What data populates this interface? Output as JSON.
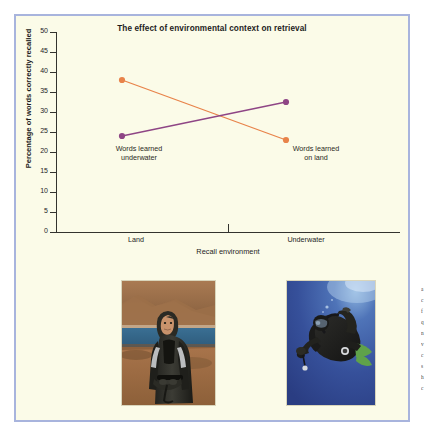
{
  "figure": {
    "background_color": "#fbfbe8",
    "border_color": "#a8b4dd"
  },
  "chart_data": {
    "type": "line",
    "title": "The effect of environmental context on retrieval",
    "xlabel": "Recall environment",
    "ylabel": "Percentage of words correctly recalled",
    "categories": [
      "Land",
      "Underwater"
    ],
    "ylim": [
      0,
      50
    ],
    "yticks": [
      0,
      5,
      10,
      15,
      20,
      25,
      30,
      35,
      40,
      45,
      50
    ],
    "grid": false,
    "legend": "none",
    "series": [
      {
        "name": "Words learned underwater",
        "color": "#e8834a",
        "values": [
          38,
          23
        ]
      },
      {
        "name": "Words learned on land",
        "color": "#8e4585",
        "values": [
          24,
          32.5
        ]
      }
    ],
    "annotations": [
      {
        "id": "underwater",
        "line1": "Words learned",
        "line2": "underwater"
      },
      {
        "id": "onland",
        "line1": "Words learned",
        "line2": "on land"
      }
    ]
  },
  "photos": [
    {
      "id": "photo-land",
      "caption": "diver-on-land-photo"
    },
    {
      "id": "photo-underwater",
      "caption": "diver-underwater-photo"
    }
  ],
  "margin_text": {
    "lines": [
      "a",
      "c",
      "f",
      "q",
      "n",
      "v",
      "c",
      "s",
      "h",
      "c"
    ]
  }
}
